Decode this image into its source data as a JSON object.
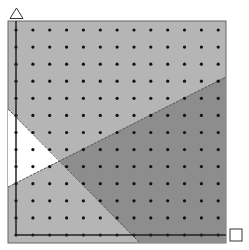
{
  "diagram": {
    "type": "geoboard-dot-grid-regions",
    "y_axis_marker": "triangle",
    "x_axis_marker": "square",
    "colors": {
      "background": "#ffffff",
      "light_region": "#b5b5b5",
      "dark_region": "#8d8d8d",
      "white_region": "#ffffff",
      "border": "#666666",
      "axis": "#222222",
      "dots": "#111111"
    },
    "frame": {
      "x": 8,
      "y": 21,
      "width": 218,
      "height": 222
    },
    "axes": {
      "origin_x": 16,
      "origin_y": 235,
      "y_top": 21,
      "x_right": 226
    },
    "grid": {
      "columns": 13,
      "rows": 13,
      "x_start": 16,
      "y_start": 30,
      "x_step": 16.85,
      "y_step": 17.08
    },
    "lines": [
      {
        "name": "line-descending",
        "from": [
          8,
          109
        ],
        "to": [
          140,
          243
        ]
      },
      {
        "name": "line-ascending",
        "from": [
          8,
          187
        ],
        "to": [
          226,
          77
        ]
      }
    ],
    "regions": [
      {
        "name": "white-region",
        "points": [
          [
            8,
            109
          ],
          [
            60,
            161
          ],
          [
            8,
            187
          ]
        ]
      },
      {
        "name": "dark-region",
        "points": [
          [
            60,
            161
          ],
          [
            226,
            77
          ],
          [
            226,
            243
          ],
          [
            140,
            243
          ]
        ]
      }
    ]
  }
}
